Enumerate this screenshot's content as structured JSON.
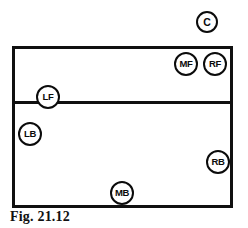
{
  "figure": {
    "caption": "Fig. 21.12",
    "court": {
      "outline_color": "#101010",
      "fill_color": "#ffffff",
      "attack_line_color": "#101010"
    },
    "marker_style": {
      "stroke_color": "#0b0b0b",
      "fill_color": "#ffffff",
      "text_color": "#0b0b0b"
    },
    "markers": [
      {
        "label": "C",
        "title": "coach-position",
        "x": 207,
        "y": 22,
        "size": "one-char"
      },
      {
        "label": "MF",
        "title": "middle-front-position",
        "x": 186,
        "y": 64,
        "size": "two-char"
      },
      {
        "label": "RF",
        "title": "right-front-position",
        "x": 215,
        "y": 64,
        "size": "two-char"
      },
      {
        "label": "LF",
        "title": "left-front-position",
        "x": 48,
        "y": 97,
        "size": "two-char"
      },
      {
        "label": "LB",
        "title": "left-back-position",
        "x": 30,
        "y": 134,
        "size": "two-char"
      },
      {
        "label": "RB",
        "title": "right-back-position",
        "x": 218,
        "y": 162,
        "size": "two-char"
      },
      {
        "label": "MB",
        "title": "middle-back-position",
        "x": 122,
        "y": 193,
        "size": "two-char"
      }
    ]
  }
}
